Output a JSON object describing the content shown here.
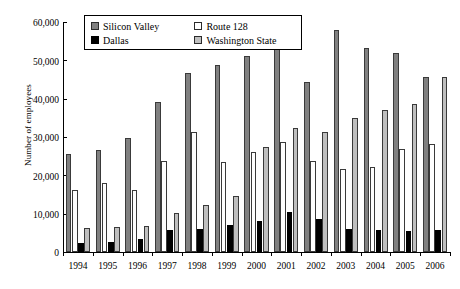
{
  "chart_data": {
    "type": "bar",
    "title": "",
    "xlabel": "",
    "ylabel": "Number of employees",
    "ylim": [
      0,
      60000
    ],
    "ytick_labels": [
      "60,000",
      "50,000",
      "40,000",
      "30,000",
      "20,000",
      "10,000",
      "0"
    ],
    "ytick_values": [
      60000,
      50000,
      40000,
      30000,
      20000,
      10000,
      0
    ],
    "grid": false,
    "legend_position": "top-center",
    "categories": [
      "1994",
      "1995",
      "1996",
      "1997",
      "1998",
      "1999",
      "2000",
      "2001",
      "2002",
      "2003",
      "2004",
      "2005",
      "2006"
    ],
    "series": [
      {
        "name": "Silicon Valley",
        "color": "#808080",
        "values": [
          25600,
          26500,
          29800,
          39200,
          46700,
          48800,
          51100,
          57000,
          44300,
          57800,
          53200,
          51800,
          45700
        ]
      },
      {
        "name": "Route 128",
        "color": "#ffffff",
        "values": [
          16100,
          18000,
          16300,
          23800,
          31200,
          23400,
          26100,
          28700,
          23800,
          21600,
          22100,
          27000,
          28200
        ]
      },
      {
        "name": "Dallas",
        "color": "#000000",
        "values": [
          2400,
          2600,
          3500,
          5800,
          5900,
          7100,
          8100,
          10400,
          8500,
          6100,
          5700,
          5500,
          5800
        ]
      },
      {
        "name": "Washington State",
        "color": "#bfbfbf",
        "values": [
          6200,
          6600,
          6700,
          10200,
          12200,
          14600,
          27400,
          32400,
          31400,
          34900,
          37100,
          38700,
          45700
        ]
      }
    ]
  },
  "legend": {
    "entries": [
      {
        "label": "Silicon Valley",
        "swatch": "s-silicon"
      },
      {
        "label": "Route 128",
        "swatch": "s-route"
      },
      {
        "label": "Dallas",
        "swatch": "s-dallas"
      },
      {
        "label": "Washington State",
        "swatch": "s-washington"
      }
    ]
  }
}
